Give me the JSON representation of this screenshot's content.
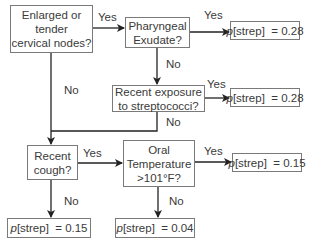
{
  "diagram": {
    "type": "decision-tree",
    "nodes": [
      {
        "id": "n1",
        "text_lines": [
          "Enlarged or",
          "tender",
          "cervical nodes?"
        ]
      },
      {
        "id": "n2",
        "text_lines": [
          "Pharyngeal",
          "Exudate?"
        ]
      },
      {
        "id": "n3",
        "text_lines": [
          "Recent exposure",
          "to streptococci?"
        ]
      },
      {
        "id": "n4",
        "text_lines": [
          "Recent",
          "cough?"
        ]
      },
      {
        "id": "n5",
        "text_lines": [
          "Oral",
          "Temperature",
          ">101°F?"
        ]
      }
    ],
    "outcomes": [
      {
        "id": "o1",
        "p_label": "p",
        "rest": "[strep]  = 0.28"
      },
      {
        "id": "o2",
        "p_label": "p",
        "rest": "[strep]  = 0.28"
      },
      {
        "id": "o3",
        "p_label": "p",
        "rest": "[strep]  = 0.15"
      },
      {
        "id": "o4",
        "p_label": "p",
        "rest": "[strep]  = 0.15"
      },
      {
        "id": "o5",
        "p_label": "p",
        "rest": "[strep]  = 0.04"
      }
    ],
    "edge_labels": {
      "n1_yes": "Yes",
      "n1_no": "No",
      "n2_yes": "Yes",
      "n2_no": "No",
      "n3_yes": "Yes",
      "n3_no": "No",
      "n4_yes": "Yes",
      "n4_no": "No",
      "n5_yes": "Yes",
      "n5_no": "No"
    },
    "edges": [
      {
        "from": "n1",
        "to": "n2",
        "label": "Yes"
      },
      {
        "from": "n1",
        "to": "n4",
        "label": "No"
      },
      {
        "from": "n2",
        "to": "o1",
        "label": "Yes"
      },
      {
        "from": "n2",
        "to": "n3",
        "label": "No"
      },
      {
        "from": "n3",
        "to": "o2",
        "label": "Yes"
      },
      {
        "from": "n3",
        "to": "n4",
        "label": "No"
      },
      {
        "from": "n4",
        "to": "n5",
        "label": "Yes"
      },
      {
        "from": "n4",
        "to": "o4",
        "label": "No"
      },
      {
        "from": "n5",
        "to": "o3",
        "label": "Yes"
      },
      {
        "from": "n5",
        "to": "o5",
        "label": "No"
      }
    ],
    "colors": {
      "line": "#222222",
      "border": "#7a7a7a",
      "text": "#3a3a3a"
    }
  }
}
